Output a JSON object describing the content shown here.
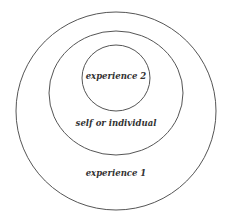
{
  "diagram": {
    "type": "nested-circles",
    "stroke_color": "#555555",
    "circles": [
      {
        "id": "outer",
        "label": "experience 1",
        "cx": 116,
        "cy": 111,
        "rx": 100,
        "ry": 99
      },
      {
        "id": "middle",
        "label": "self or individual",
        "cx": 116,
        "cy": 93,
        "rx": 67,
        "ry": 62
      },
      {
        "id": "inner",
        "label": "experience 2",
        "cx": 116,
        "cy": 78,
        "rx": 34,
        "ry": 33
      }
    ]
  }
}
